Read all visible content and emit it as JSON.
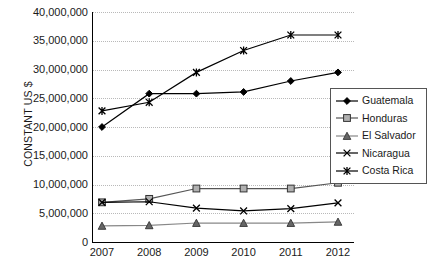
{
  "chart_data": {
    "type": "line",
    "title": "",
    "xlabel": "",
    "ylabel": "CONSTANT US $",
    "x": [
      2007,
      2008,
      2009,
      2010,
      2011,
      2012
    ],
    "categories": [
      "2007",
      "2008",
      "2009",
      "2010",
      "2011",
      "2012"
    ],
    "ylim": [
      0,
      40000000
    ],
    "ytick_labels": [
      "40,000,000",
      "35,000,000",
      "30,000,000",
      "25,000,000",
      "20,000,000",
      "15,000,000",
      "10,000,000",
      "5,000,000",
      "0"
    ],
    "ytick_values": [
      40000000,
      35000000,
      30000000,
      25000000,
      20000000,
      15000000,
      10000000,
      5000000,
      0
    ],
    "grid": true,
    "legend_position": "right",
    "series": [
      {
        "name": "Guatemala",
        "marker": "diamond",
        "color": "#000000",
        "values": [
          20000000,
          25800000,
          25800000,
          26100000,
          28000000,
          29500000
        ]
      },
      {
        "name": "Honduras",
        "marker": "square",
        "color": "#555555",
        "values": [
          6900000,
          7500000,
          9300000,
          9300000,
          9300000,
          10300000
        ]
      },
      {
        "name": "El Salvador",
        "marker": "triangle",
        "color": "#888888",
        "values": [
          2800000,
          2900000,
          3300000,
          3300000,
          3300000,
          3500000
        ]
      },
      {
        "name": "Nicaragua",
        "marker": "x",
        "color": "#000000",
        "values": [
          6900000,
          7000000,
          5900000,
          5400000,
          5800000,
          6800000
        ]
      },
      {
        "name": "Costa Rica",
        "marker": "asterisk",
        "color": "#000000",
        "values": [
          22800000,
          24300000,
          29500000,
          33300000,
          36000000,
          36000000
        ]
      }
    ]
  },
  "legend": {
    "items": [
      {
        "label": "Guatemala"
      },
      {
        "label": "Honduras"
      },
      {
        "label": "El Salvador"
      },
      {
        "label": "Nicaragua"
      },
      {
        "label": "Costa Rica"
      }
    ]
  }
}
